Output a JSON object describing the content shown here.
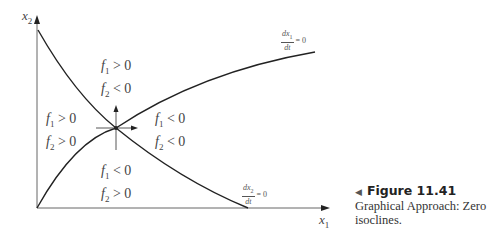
{
  "figure": {
    "number": "Figure 11.41",
    "caption": "Graphical Approach: Zero isoclines."
  },
  "axes": {
    "x_label": "x",
    "x_sub": "1",
    "y_label": "x",
    "y_sub": "2"
  },
  "isoclines": {
    "dx1": {
      "num": "dx",
      "num_sub": "1",
      "den": "dt",
      "eq": "= 0"
    },
    "dx2": {
      "num": "dx",
      "num_sub": "2",
      "den": "dt",
      "eq": "= 0"
    }
  },
  "regions": {
    "top": {
      "line1": "f",
      "line1_sub": "1",
      "line1_rel": " > 0",
      "line2": "f",
      "line2_sub": "2",
      "line2_rel": " < 0"
    },
    "left": {
      "line1": "f",
      "line1_sub": "1",
      "line1_rel": " > 0",
      "line2": "f",
      "line2_sub": "2",
      "line2_rel": " > 0"
    },
    "right": {
      "line1": "f",
      "line1_sub": "1",
      "line1_rel": " < 0",
      "line2": "f",
      "line2_sub": "2",
      "line2_rel": " < 0"
    },
    "bottom": {
      "line1": "f",
      "line1_sub": "1",
      "line1_rel": " < 0",
      "line2": "f",
      "line2_sub": "2",
      "line2_rel": " > 0"
    }
  },
  "colors": {
    "line": "#222222",
    "axis": "#555555"
  }
}
